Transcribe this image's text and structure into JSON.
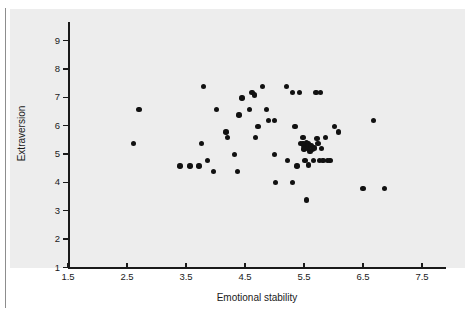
{
  "chart_data": {
    "type": "scatter",
    "title": "",
    "xlabel": "Emotional stability",
    "ylabel": "Extraversion",
    "xlim": [
      1.5,
      7.9
    ],
    "ylim": [
      1,
      9.3
    ],
    "grid": false,
    "legend": null,
    "marker": {
      "shape": "circle",
      "color": "#111111",
      "size_px": 5.4
    },
    "axis_color": "#1a1a1a",
    "panel_color": "#ededed",
    "page_color": "#ffffff",
    "xticks": [
      1.5,
      2.5,
      3.5,
      4.5,
      5.5,
      6.5,
      7.5
    ],
    "xtick_labels": [
      "1.5",
      "2.5",
      "3.5",
      "4.5",
      "5.5",
      "6.5",
      "7.5"
    ],
    "yticks": [
      1,
      2,
      3,
      4,
      5,
      6,
      7,
      8,
      9
    ],
    "ytick_labels": [
      "1",
      "2",
      "3",
      "4",
      "5",
      "6",
      "7",
      "8",
      "9"
    ],
    "n_points": 65,
    "points": [
      [
        2.7,
        6.58
      ],
      [
        2.61,
        5.38
      ],
      [
        3.4,
        4.58
      ],
      [
        3.57,
        4.58
      ],
      [
        3.72,
        4.58
      ],
      [
        3.76,
        5.38
      ],
      [
        3.8,
        7.38
      ],
      [
        3.86,
        4.78
      ],
      [
        3.97,
        4.38
      ],
      [
        4.02,
        6.58
      ],
      [
        4.18,
        5.78
      ],
      [
        4.2,
        5.58
      ],
      [
        4.32,
        4.98
      ],
      [
        4.37,
        4.38
      ],
      [
        4.4,
        6.38
      ],
      [
        4.45,
        6.98
      ],
      [
        4.58,
        6.58
      ],
      [
        4.62,
        7.18
      ],
      [
        4.66,
        7.08
      ],
      [
        4.68,
        5.58
      ],
      [
        4.72,
        5.98
      ],
      [
        4.8,
        7.38
      ],
      [
        4.86,
        6.58
      ],
      [
        4.9,
        6.18
      ],
      [
        5.0,
        6.18
      ],
      [
        5.0,
        4.98
      ],
      [
        5.02,
        4.0
      ],
      [
        5.2,
        7.38
      ],
      [
        5.22,
        4.78
      ],
      [
        5.3,
        7.18
      ],
      [
        5.3,
        4.0
      ],
      [
        5.35,
        5.98
      ],
      [
        5.38,
        4.58
      ],
      [
        5.42,
        7.18
      ],
      [
        5.44,
        5.38
      ],
      [
        5.48,
        5.58
      ],
      [
        5.5,
        5.3
      ],
      [
        5.5,
        5.18
      ],
      [
        5.52,
        4.78
      ],
      [
        5.54,
        5.42
      ],
      [
        5.54,
        3.38
      ],
      [
        5.56,
        5.22
      ],
      [
        5.58,
        5.38
      ],
      [
        5.58,
        4.62
      ],
      [
        5.6,
        5.1
      ],
      [
        5.62,
        5.3
      ],
      [
        5.64,
        5.18
      ],
      [
        5.66,
        4.78
      ],
      [
        5.68,
        5.22
      ],
      [
        5.7,
        7.18
      ],
      [
        5.72,
        5.56
      ],
      [
        5.74,
        5.38
      ],
      [
        5.76,
        4.78
      ],
      [
        5.78,
        7.18
      ],
      [
        5.8,
        5.2
      ],
      [
        5.82,
        4.78
      ],
      [
        5.86,
        5.58
      ],
      [
        5.9,
        4.78
      ],
      [
        5.94,
        4.78
      ],
      [
        6.02,
        5.98
      ],
      [
        6.08,
        5.78
      ],
      [
        6.5,
        3.78
      ],
      [
        6.68,
        6.18
      ],
      [
        6.86,
        3.78
      ],
      [
        5.48,
        5.38
      ]
    ]
  }
}
